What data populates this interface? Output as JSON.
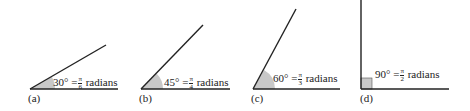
{
  "figure": {
    "panels": [
      {
        "caption": "(a)",
        "degrees": "30°",
        "equals": "=",
        "num": "π",
        "den": "6",
        "unit": "radians",
        "angle_deg": 30
      },
      {
        "caption": "(b)",
        "degrees": "45°",
        "equals": "=",
        "num": "π",
        "den": "4",
        "unit": "radians",
        "angle_deg": 45
      },
      {
        "caption": "(c)",
        "degrees": "60°",
        "equals": "=",
        "num": "π",
        "den": "3",
        "unit": "radians",
        "angle_deg": 60
      },
      {
        "caption": "(d)",
        "degrees": "90°",
        "equals": "=",
        "num": "π",
        "den": "2",
        "unit": "radians",
        "angle_deg": 90
      }
    ],
    "colors": {
      "line": "#222222",
      "shade": "#c8c8c8"
    }
  }
}
